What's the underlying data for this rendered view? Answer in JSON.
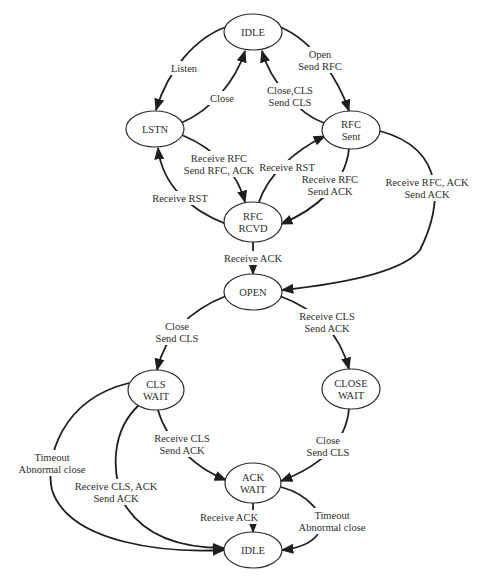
{
  "diagram": {
    "type": "state-transition",
    "nodes": [
      {
        "id": "idle_top",
        "lines": [
          "IDLE"
        ],
        "cx": 253,
        "cy": 32,
        "rx": 29,
        "ry": 18
      },
      {
        "id": "lstn",
        "lines": [
          "LSTN"
        ],
        "cx": 155,
        "cy": 129,
        "rx": 29,
        "ry": 18
      },
      {
        "id": "rfc_sent",
        "lines": [
          "RFC",
          "Sent"
        ],
        "cx": 351,
        "cy": 130,
        "rx": 29,
        "ry": 19
      },
      {
        "id": "rfc_rcvd",
        "lines": [
          "RFC",
          "RCVD"
        ],
        "cx": 253,
        "cy": 222,
        "rx": 29,
        "ry": 20
      },
      {
        "id": "open",
        "lines": [
          "OPEN"
        ],
        "cx": 253,
        "cy": 292,
        "rx": 29,
        "ry": 18
      },
      {
        "id": "cls_wait",
        "lines": [
          "CLS",
          "WAIT"
        ],
        "cx": 156,
        "cy": 390,
        "rx": 28,
        "ry": 20
      },
      {
        "id": "close_wait",
        "lines": [
          "CLOSE",
          "WAIT"
        ],
        "cx": 351,
        "cy": 389,
        "rx": 29,
        "ry": 20
      },
      {
        "id": "ack_wait",
        "lines": [
          "ACK",
          "WAIT"
        ],
        "cx": 253,
        "cy": 483,
        "rx": 28,
        "ry": 20
      },
      {
        "id": "idle_bottom",
        "lines": [
          "IDLE"
        ],
        "cx": 253,
        "cy": 550,
        "rx": 29,
        "ry": 18
      }
    ],
    "edges": [
      {
        "from": "idle_top",
        "to": "lstn",
        "label": [
          "Listen"
        ],
        "path": "M226,27 C195,38 168,70 156,110",
        "lx": 184,
        "ly": 68
      },
      {
        "from": "lstn",
        "to": "idle_top",
        "label": [
          "Close"
        ],
        "path": "M181,123 C212,110 236,80 245,51",
        "lx": 222,
        "ly": 98
      },
      {
        "from": "idle_top",
        "to": "rfc_sent",
        "label": [
          "Open",
          "Send RFC"
        ],
        "path": "M280,27 C312,40 338,78 349,111",
        "lx": 320,
        "ly": 60
      },
      {
        "from": "rfc_sent",
        "to": "idle_top",
        "label": [
          "Close,CLS",
          "Send CLS"
        ],
        "path": "M324,123 C298,114 270,80 262,51",
        "lx": 290,
        "ly": 96
      },
      {
        "from": "lstn",
        "to": "rfc_rcvd",
        "label": [
          "Receive RFC",
          "Send RFC, ACK"
        ],
        "path": "M182,135 C218,150 238,175 245,202",
        "lx": 219,
        "ly": 164
      },
      {
        "from": "rfc_rcvd",
        "to": "lstn",
        "label": [
          "Receive RST"
        ],
        "path": "M226,224 C190,210 162,185 158,148",
        "lx": 180,
        "ly": 198
      },
      {
        "from": "rfc_rcvd",
        "to": "rfc_sent",
        "label": [
          "Receive RST"
        ],
        "path": "M259,202 C268,175 295,150 325,136",
        "lx": 287,
        "ly": 167
      },
      {
        "from": "rfc_sent",
        "to": "rfc_rcvd",
        "label": [
          "Receive RFC",
          "Send ACK"
        ],
        "path": "M349,149 C345,185 315,210 281,224",
        "lx": 330,
        "ly": 185
      },
      {
        "from": "rfc_rcvd",
        "to": "open",
        "label": [
          "Receive ACK"
        ],
        "path": "M253,242 L253,274",
        "lx": 253,
        "ly": 258
      },
      {
        "from": "rfc_sent",
        "to": "open",
        "label": [
          "Receive RFC, ACK",
          "Send ACK"
        ],
        "path": "M380,131 C450,150 440,210 420,250 C400,275 330,285 282,290",
        "lx": 427,
        "ly": 188
      },
      {
        "from": "open",
        "to": "cls_wait",
        "label": [
          "Close",
          "Send CLS"
        ],
        "path": "M226,296 C190,310 165,335 157,370",
        "lx": 177,
        "ly": 332
      },
      {
        "from": "open",
        "to": "close_wait",
        "label": [
          "Receive CLS",
          "Send ACK"
        ],
        "path": "M280,296 C318,310 340,335 349,369",
        "lx": 327,
        "ly": 322
      },
      {
        "from": "cls_wait",
        "to": "ack_wait",
        "label": [
          "Receive CLS",
          "Send ACK"
        ],
        "path": "M158,410 C168,445 200,470 226,480",
        "lx": 182,
        "ly": 444
      },
      {
        "from": "close_wait",
        "to": "ack_wait",
        "label": [
          "Close",
          "Send CLS"
        ],
        "path": "M349,409 C345,450 310,470 281,481",
        "lx": 328,
        "ly": 446
      },
      {
        "from": "cls_wait",
        "to": "idle_bottom",
        "label": [
          "Timeout",
          "Abnormal close"
        ],
        "path": "M129,383 C60,400 45,460 52,490 C70,545 170,553 224,550",
        "lx": 52,
        "ly": 463
      },
      {
        "from": "cls_wait",
        "to": "idle_bottom",
        "label": [
          "Receive CLS, ACK",
          "Send ACK"
        ],
        "path": "M139,405 C112,430 110,470 125,505 C150,545 200,548 224,548",
        "lx": 116,
        "ly": 492
      },
      {
        "from": "ack_wait",
        "to": "idle_bottom",
        "label": [
          "Receive ACK"
        ],
        "path": "M253,503 L253,532",
        "lx": 229,
        "ly": 517
      },
      {
        "from": "ack_wait",
        "to": "idle_bottom",
        "label": [
          "Timeout",
          "Abnormal close"
        ],
        "path": "M281,487 C310,495 325,515 320,530 C315,542 300,548 282,550",
        "lx": 332,
        "ly": 521
      }
    ]
  }
}
